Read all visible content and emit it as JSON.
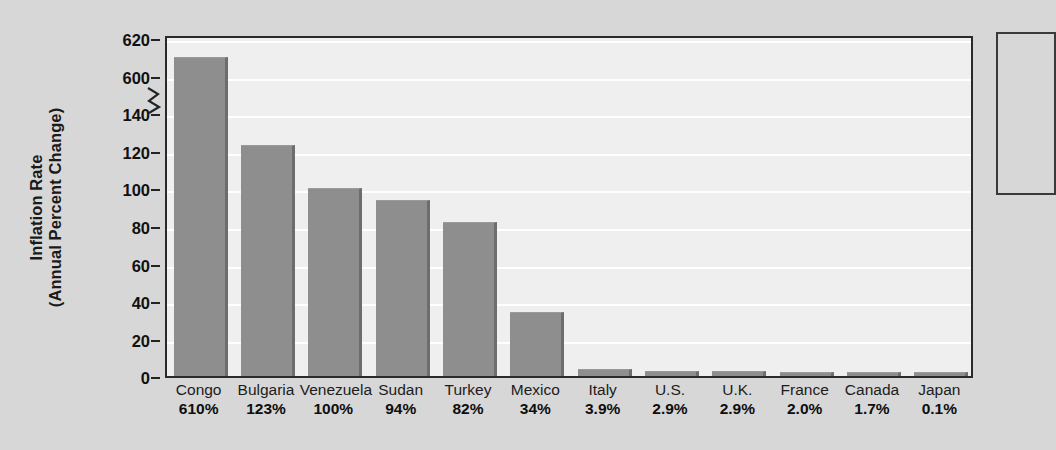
{
  "chart_data": {
    "type": "bar",
    "title": "",
    "subtitle": "",
    "xlabel": "",
    "ylabel": "Inflation Rate (Annual Percent Change)",
    "ylabel_lines": [
      "Inflation Rate",
      "(Annual Percent Change)"
    ],
    "categories": [
      "Congo",
      "Bulgaria",
      "Venezuela",
      "Sudan",
      "Turkey",
      "Mexico",
      "Italy",
      "U.S.",
      "U.K.",
      "France",
      "Canada",
      "Japan"
    ],
    "values": [
      610,
      123,
      100,
      94,
      82,
      34,
      3.9,
      2.9,
      2.9,
      2.0,
      1.7,
      0.1
    ],
    "value_labels": [
      "610%",
      "123%",
      "100%",
      "94%",
      "82%",
      "34%",
      "3.9%",
      "2.9%",
      "2.9%",
      "2.0%",
      "1.7%",
      "0.1%"
    ],
    "axis_break": true,
    "axis_break_between": [
      140,
      600
    ],
    "ytick_labels": [
      "620",
      "600",
      "140",
      "120",
      "100",
      "80",
      "60",
      "40",
      "20",
      "0"
    ],
    "ytick_values": [
      620,
      600,
      140,
      120,
      100,
      80,
      60,
      40,
      20,
      0
    ],
    "ylim": [
      0,
      620
    ],
    "grid": true,
    "grid_axis": "y",
    "legend": "none",
    "bar_color": "#8e8e8e",
    "bar_edge_color": "#6d6d6d",
    "plot_bg_color": "#efefef",
    "figure_bg_color": "#d7d7d7",
    "gridline_color": "#ffffff",
    "axis_color": "#2a2a2a",
    "text_color": "#111111"
  },
  "annotation_box": {
    "present": true,
    "text": ""
  }
}
